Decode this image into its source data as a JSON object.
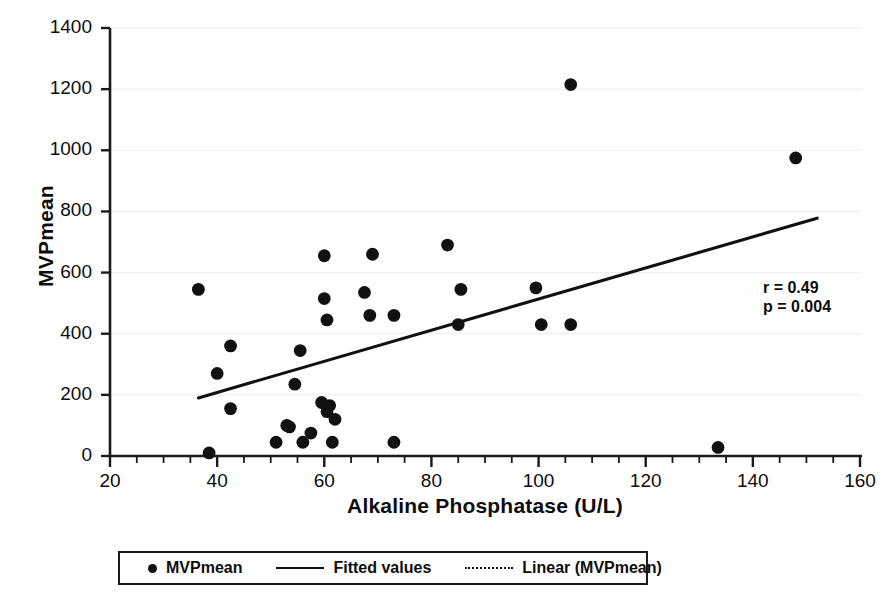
{
  "chart_data": {
    "type": "scatter",
    "title": "",
    "xlabel": "Alkaline Phosphatase  (U/L)",
    "ylabel": "MVPmean",
    "xlim": [
      20,
      160
    ],
    "ylim": [
      0,
      1400
    ],
    "xticks": [
      20,
      40,
      60,
      80,
      100,
      120,
      140,
      160
    ],
    "yticks": [
      0,
      200,
      400,
      600,
      800,
      1000,
      1200,
      1400
    ],
    "xtick_labels": [
      "20",
      "40",
      "60",
      "80",
      "100",
      "120",
      "140",
      "160"
    ],
    "ytick_labels": [
      "0",
      "200",
      "400",
      "600",
      "800",
      "1000",
      "1200",
      "1400"
    ],
    "x_minor_tick_step": 5,
    "grid": "horizontal-only-light",
    "legend_position": "bottom-outside",
    "marker_color": "#111111",
    "line_color": "#111111",
    "series": [
      {
        "name": "MVPmean",
        "type": "scatter",
        "x": [
          36.5,
          38.5,
          40.0,
          42.5,
          42.5,
          51.0,
          53.0,
          53.5,
          54.5,
          55.5,
          56.0,
          57.5,
          59.5,
          60.0,
          60.0,
          60.5,
          60.5,
          61.0,
          61.5,
          62.0,
          67.5,
          68.5,
          69.0,
          73.0,
          73.0,
          83.0,
          85.0,
          85.5,
          99.5,
          100.5,
          106.0,
          106.0,
          133.5,
          148.0
        ],
        "y": [
          545,
          10,
          270,
          360,
          155,
          45,
          100,
          95,
          235,
          345,
          45,
          75,
          175,
          655,
          515,
          445,
          145,
          165,
          45,
          120,
          535,
          460,
          660,
          460,
          45,
          690,
          430,
          545,
          550,
          430,
          1215,
          430,
          28,
          975
        ]
      },
      {
        "name": "Fitted values",
        "type": "line",
        "x_start": 36.5,
        "y_start": 190,
        "x_end": 152.0,
        "y_end": 778
      },
      {
        "name": "Linear (MVPmean)",
        "type": "line-dotted"
      }
    ],
    "annotations": [
      {
        "text": "r = 0.49",
        "x": 131,
        "y": 565
      },
      {
        "text": "p = 0.004",
        "x": 131,
        "y": 510
      }
    ]
  },
  "axes": {
    "y_title": "MVPmean",
    "x_title": "Alkaline Phosphatase  (U/L)"
  },
  "annotation": {
    "r_value": "r = 0.49",
    "p_value": "p = 0.004"
  },
  "legend": {
    "items": [
      {
        "label": "MVPmean",
        "marker": "filled-circle-marker"
      },
      {
        "label": "Fitted values",
        "marker": "solid-line-marker"
      },
      {
        "label": "Linear (MVPmean)",
        "marker": "dotted-line-marker"
      }
    ]
  }
}
